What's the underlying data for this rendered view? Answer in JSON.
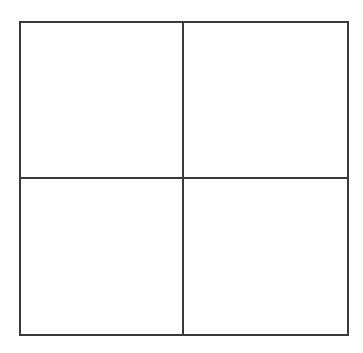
{
  "diagram": {
    "type": "grid",
    "rows": 2,
    "columns": 2,
    "line_color": "#3a3a3a",
    "background": "#ffffff",
    "cells": [
      {
        "row": 1,
        "col": 1,
        "label": ""
      },
      {
        "row": 1,
        "col": 2,
        "label": ""
      },
      {
        "row": 2,
        "col": 1,
        "label": ""
      },
      {
        "row": 2,
        "col": 2,
        "label": ""
      }
    ]
  }
}
